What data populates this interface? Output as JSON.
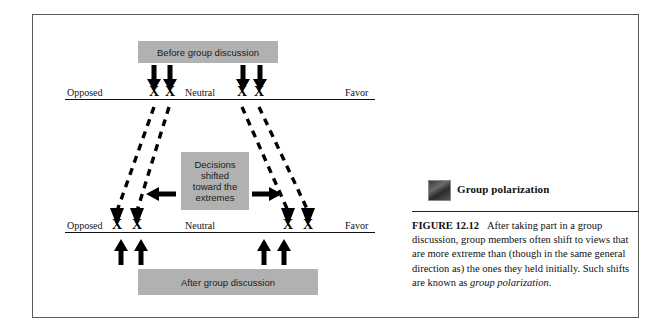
{
  "figure": {
    "thumbnail_title": "Group polarization",
    "caption_number": "FIGURE 12.12",
    "caption_body": "After taking part in a group discussion, group members often shift to views that are more extreme than (though in the same general direction as) the ones they held initially. Such shifts are known as ",
    "caption_italic_term": "group polarization",
    "caption_end": "."
  },
  "diagram": {
    "before_box_label": "Before group discussion",
    "after_box_label": "After group discussion",
    "shift_box_lines": [
      "Decisions",
      "shifted",
      "toward the",
      "extremes"
    ],
    "top_scale": {
      "left_label": "Opposed",
      "center_label": "Neutral",
      "right_label": "Favor",
      "marks": [
        "X",
        "X",
        "X",
        "X"
      ]
    },
    "bottom_scale": {
      "left_label": "Opposed",
      "center_label": "Neutral",
      "right_label": "Favor",
      "marks": [
        "X",
        "X",
        "X",
        "X"
      ]
    }
  },
  "colors": {
    "box_fill": "#b1b1b1",
    "frame_border": "#5a5a5a",
    "ink": "#111111",
    "page_background": "#ffffff"
  }
}
